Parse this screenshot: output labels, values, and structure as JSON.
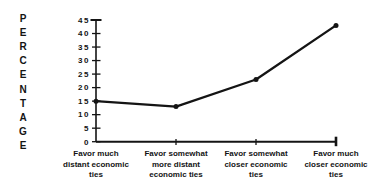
{
  "figure": {
    "background": "#ffffff",
    "ink_color": "#141414"
  },
  "chart_data": {
    "type": "line",
    "title": "",
    "xlabel": "",
    "ylabel": "PERCENTAGE",
    "categories": [
      "Favor much distant economic ties",
      "Favor somewhat more distant economic ties",
      "Favor somewhat closer economic ties",
      "Favor much closer economic ties"
    ],
    "category_label_lines": [
      [
        "Favor much",
        "distant economic",
        "ties"
      ],
      [
        "Favor somewhat",
        "more distant",
        "economic ties"
      ],
      [
        "Favor somewhat",
        "closer economic",
        "ties"
      ],
      [
        "Favor much",
        "closer economic",
        "ties"
      ]
    ],
    "series": [
      {
        "name": "Percentage favoring",
        "values": [
          15,
          13,
          23,
          43
        ]
      }
    ],
    "ylim": [
      0,
      45
    ],
    "ytick_interval": 5,
    "ytick_labels": [
      "0",
      "5",
      "10",
      "15",
      "20",
      "25",
      "30",
      "35",
      "40",
      "45"
    ],
    "grid": false,
    "legend": "none",
    "line_color": "#141414",
    "marker": "dot"
  }
}
